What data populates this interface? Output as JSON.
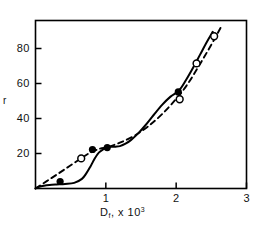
{
  "chart_data": {
    "type": "line",
    "title": "",
    "xlabel": "D, x 10",
    "xlabel_sub": "f",
    "xlabel_exp": "3",
    "ylabel": "r",
    "xlim": [
      0,
      3
    ],
    "ylim": [
      0,
      96
    ],
    "xticks": [
      1,
      2,
      3
    ],
    "xtick_labels": [
      "1",
      "2",
      "3"
    ],
    "yticks": [
      20,
      40,
      60,
      80
    ],
    "ytick_labels": [
      "20",
      "40",
      "60",
      "80"
    ],
    "grid": false,
    "legend": "none",
    "frame": "box",
    "series": [
      {
        "name": "solid-curve",
        "style": "solid",
        "marker": "none",
        "x": [
          0.0,
          0.05,
          0.12,
          0.2,
          0.3,
          0.42,
          0.55,
          0.66,
          0.72,
          0.78,
          0.84,
          0.9,
          0.96,
          1.02,
          1.08,
          1.14,
          1.2,
          1.28,
          1.36,
          1.46,
          1.56,
          1.68,
          1.8,
          1.92,
          2.04,
          2.14,
          2.24,
          2.34,
          2.44,
          2.52
        ],
        "y": [
          0.0,
          1.0,
          1.6,
          2.0,
          2.3,
          2.6,
          3.2,
          5.5,
          8.5,
          12.5,
          17.0,
          20.5,
          22.3,
          23.3,
          23.8,
          23.9,
          24.2,
          25.6,
          27.8,
          31.5,
          36.0,
          42.0,
          47.8,
          52.5,
          56.0,
          62.0,
          69.0,
          76.5,
          84.0,
          89.5
        ]
      },
      {
        "name": "dashed-curve",
        "style": "dashed",
        "marker": "none",
        "x": [
          0.0,
          0.16,
          0.32,
          0.48,
          0.64,
          0.78,
          0.92,
          1.02,
          1.2,
          1.4,
          1.6,
          1.8,
          2.0,
          2.16,
          2.3,
          2.44,
          2.56,
          2.64
        ],
        "y": [
          0.0,
          4.2,
          8.4,
          12.7,
          17.0,
          20.5,
          22.8,
          23.6,
          26.2,
          30.0,
          35.5,
          42.5,
          51.2,
          59.5,
          68.5,
          78.0,
          86.5,
          92.5
        ]
      }
    ],
    "points_filled": [
      {
        "x": 0.35,
        "y": 4.0
      },
      {
        "x": 0.81,
        "y": 22.3
      },
      {
        "x": 1.02,
        "y": 23.4
      },
      {
        "x": 2.03,
        "y": 55.2
      }
    ],
    "points_open": [
      {
        "x": 0.65,
        "y": 17.2
      },
      {
        "x": 2.05,
        "y": 51.0
      },
      {
        "x": 2.29,
        "y": 71.5
      },
      {
        "x": 2.54,
        "y": 87.0
      }
    ]
  },
  "colors": {
    "line": "#000000",
    "frame": "#000000",
    "background": "#ffffff",
    "marker_fill": "#000000",
    "marker_open_fill": "#ffffff"
  }
}
